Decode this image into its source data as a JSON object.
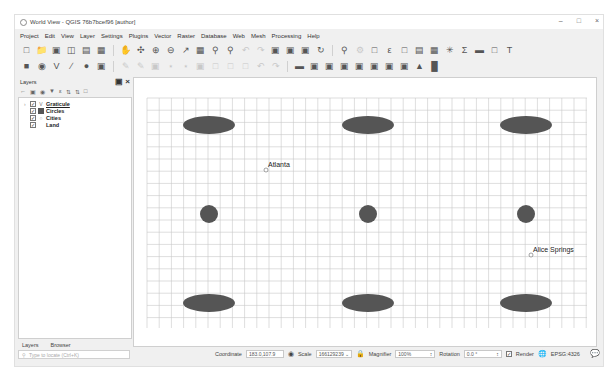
{
  "window": {
    "title": "World View - QGIS 76b7bcef96 [author]",
    "controls": [
      "minimize",
      "maximize",
      "close"
    ]
  },
  "menubar": {
    "items": [
      "Project",
      "Edit",
      "View",
      "Layer",
      "Settings",
      "Plugins",
      "Vector",
      "Raster",
      "Database",
      "Web",
      "Mesh",
      "Processing",
      "Help"
    ]
  },
  "layers_panel": {
    "title": "Layers",
    "layers": [
      {
        "name": "Graticule",
        "checked": true,
        "symbol": "line",
        "active": true
      },
      {
        "name": "Circles",
        "checked": true,
        "symbol": "fill"
      },
      {
        "name": "Cities",
        "checked": true,
        "symbol": "point"
      },
      {
        "name": "Land",
        "checked": true,
        "symbol": "none"
      }
    ],
    "tabs": [
      "Layers",
      "Browser"
    ],
    "locator_placeholder": "Type to locate (Ctrl+K)"
  },
  "map": {
    "labels": [
      {
        "text": "Atlanta",
        "feature": "city"
      },
      {
        "text": "Alice Springs",
        "feature": "city"
      }
    ],
    "feature_color": "#555555",
    "grid_color": "#c8c8c8"
  },
  "statusbar": {
    "coordinate_label": "Coordinate",
    "coordinate_value": "183.0,107.9",
    "scale_label": "Scale",
    "scale_value": "166129239",
    "magnifier_label": "Magnifier",
    "magnifier_value": "100%",
    "rotation_label": "Rotation",
    "rotation_value": "0.0 °",
    "render_label": "Render",
    "render_checked": true,
    "crs_label": "EPSG:4326"
  }
}
